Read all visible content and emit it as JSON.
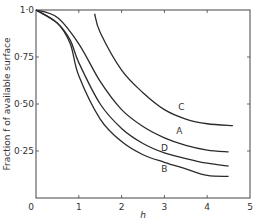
{
  "chart_data": {
    "type": "line",
    "title": "",
    "xlabel": "h",
    "ylabel": "Fraction f of available surface",
    "xlim": [
      0,
      5
    ],
    "ylim": [
      0,
      1.0
    ],
    "grid": false,
    "legend": "inline curve labels",
    "x_ticks": [
      "0",
      "1",
      "2",
      "3",
      "4",
      "5"
    ],
    "y_ticks": [
      "1·0",
      "0·75",
      "0·50",
      "0·25"
    ],
    "series": [
      {
        "name": "A",
        "label_pos": [
          3.35,
          0.34
        ],
        "points": [
          [
            0,
            1.0
          ],
          [
            0.5,
            0.96
          ],
          [
            1,
            0.82
          ],
          [
            1.5,
            0.62
          ],
          [
            2,
            0.47
          ],
          [
            2.5,
            0.38
          ],
          [
            3,
            0.32
          ],
          [
            3.5,
            0.28
          ],
          [
            4,
            0.255
          ],
          [
            4.5,
            0.245
          ]
        ]
      },
      {
        "name": "B",
        "label_pos": [
          3.0,
          0.14
        ],
        "points": [
          [
            0,
            1.0
          ],
          [
            0.5,
            0.93
          ],
          [
            0.8,
            0.82
          ],
          [
            1,
            0.65
          ],
          [
            1.5,
            0.42
          ],
          [
            2,
            0.3
          ],
          [
            2.5,
            0.23
          ],
          [
            3,
            0.19
          ],
          [
            3.5,
            0.155
          ],
          [
            4,
            0.12
          ],
          [
            4.5,
            0.115
          ]
        ]
      },
      {
        "name": "C",
        "label_pos": [
          3.4,
          0.47
        ],
        "points": [
          [
            1.37,
            0.98
          ],
          [
            1.5,
            0.88
          ],
          [
            2,
            0.68
          ],
          [
            2.5,
            0.56
          ],
          [
            3,
            0.47
          ],
          [
            3.5,
            0.42
          ],
          [
            4,
            0.395
          ],
          [
            4.6,
            0.385
          ]
        ]
      },
      {
        "name": "D",
        "label_pos": [
          3.0,
          0.25
        ],
        "points": [
          [
            0,
            1.0
          ],
          [
            0.5,
            0.93
          ],
          [
            0.8,
            0.84
          ],
          [
            1,
            0.72
          ],
          [
            1.5,
            0.5
          ],
          [
            2,
            0.37
          ],
          [
            2.5,
            0.29
          ],
          [
            3,
            0.24
          ],
          [
            3.5,
            0.21
          ],
          [
            4,
            0.185
          ],
          [
            4.5,
            0.17
          ]
        ]
      }
    ]
  },
  "axes": {
    "x_title": "h",
    "y_title": "Fraction f of available surface"
  },
  "style": {
    "line_color": "#2a2a2a",
    "axis_color": "#444444",
    "background": "#ffffff"
  }
}
